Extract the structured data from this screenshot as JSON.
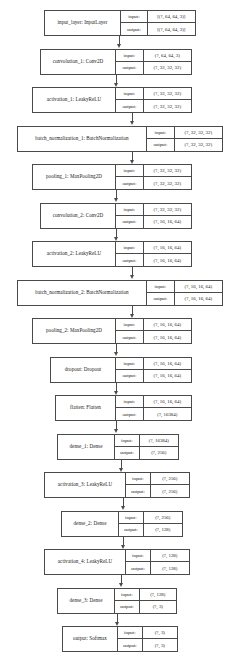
{
  "diagram": {
    "io_labels": {
      "input": "input:",
      "output": "output:"
    },
    "edge_icon": "arrow-down-icon",
    "nodes": [
      {
        "id": "input_layer",
        "label": "input_layer: InputLayer",
        "input": "[(?, 64, 64, 3)]",
        "output": "[(?, 64, 64, 3)]",
        "box_x": 44,
        "box_w": 152,
        "box_y": 10,
        "name_w": 77,
        "io_label_w": 27,
        "io_shape_w": 48
      },
      {
        "id": "convolution_1",
        "label": "convolution_1: Conv2D",
        "input": "(?, 64, 64, 3)",
        "output": "(?, 32, 32, 32)",
        "box_x": 40,
        "box_w": 152,
        "box_y": 63,
        "name_w": 76,
        "io_label_w": 28,
        "io_shape_w": 48
      },
      {
        "id": "activation_1",
        "label": "activation_1: LeakyReLU",
        "input": "(?, 32, 32, 32)",
        "output": "(?, 32, 32, 32)",
        "box_x": 32,
        "box_w": 160,
        "box_y": 116,
        "name_w": 84,
        "io_label_w": 28,
        "io_shape_w": 48
      },
      {
        "id": "batch_normalization_1",
        "label": "batch_normalization_1: BatchNormalization",
        "input": "(?, 32, 32, 32)",
        "output": "(?, 32, 32, 32)",
        "box_x": 17,
        "box_w": 206,
        "box_y": 169,
        "name_w": 130,
        "io_label_w": 28,
        "io_shape_w": 48
      },
      {
        "id": "pooling_1",
        "label": "pooling_1: MaxPooling2D",
        "input": "(?, 32, 32, 32)",
        "output": "(?, 32, 32, 32)",
        "box_x": 32,
        "box_w": 160,
        "box_y": 222,
        "name_w": 84,
        "io_label_w": 28,
        "io_shape_w": 48
      },
      {
        "id": "convolution_2",
        "label": "convolution_2: Conv2D",
        "input": "(?, 32, 32, 32)",
        "output": "(?, 16, 16, 64)",
        "box_x": 40,
        "box_w": 152,
        "box_y": 275,
        "name_w": 76,
        "io_label_w": 28,
        "io_shape_w": 48
      },
      {
        "id": "activation_2",
        "label": "activation_2: LeakyReLU",
        "input": "(?, 16, 16, 64)",
        "output": "(?, 16, 16, 64)",
        "box_x": 32,
        "box_w": 160,
        "box_y": 328,
        "name_w": 84,
        "io_label_w": 28,
        "io_shape_w": 48
      },
      {
        "id": "batch_normalization_2",
        "label": "batch_normalization_2: BatchNormalization",
        "input": "(?, 16, 16, 64)",
        "output": "(?, 16, 16, 64)",
        "box_x": 17,
        "box_w": 206,
        "box_y": 381,
        "name_w": 130,
        "io_label_w": 28,
        "io_shape_w": 48
      },
      {
        "id": "pooling_2",
        "label": "pooling_2: MaxPooling2D",
        "input": "(?, 16, 16, 64)",
        "output": "(?, 16, 16, 64)",
        "box_x": 32,
        "box_w": 160,
        "box_y": 434,
        "name_w": 84,
        "io_label_w": 28,
        "io_shape_w": 48
      },
      {
        "id": "dropout",
        "label": "dropout: Dropout",
        "input": "(?, 16, 16, 64)",
        "output": "(?, 16, 16, 64)",
        "box_x": 50,
        "box_w": 142,
        "box_y": 487,
        "name_w": 66,
        "io_label_w": 28,
        "io_shape_w": 48
      },
      {
        "id": "flatten",
        "label": "flatten: Flatten",
        "input": "(?, 16, 16, 64)",
        "output": "(?, 16384)",
        "box_x": 55,
        "box_w": 137,
        "box_y": 540,
        "name_w": 61,
        "io_label_w": 28,
        "io_shape_w": 48
      },
      {
        "id": "dense_1",
        "label": "dense_1: Dense",
        "input": "(?, 16384)",
        "output": "(?, 256)",
        "box_x": 57,
        "box_w": 122,
        "box_y": 593,
        "name_w": 58,
        "io_label_w": 25,
        "io_shape_w": 39
      },
      {
        "id": "activation_3",
        "label": "activation_3: LeakyReLU",
        "input": "(?, 256)",
        "output": "(?, 256)",
        "box_x": 44,
        "box_w": 146,
        "box_y": 646,
        "name_w": 82,
        "io_label_w": 25,
        "io_shape_w": 39
      },
      {
        "id": "dense_2",
        "label": "dense_2: Dense",
        "input": "(?, 256)",
        "output": "(?, 128)",
        "box_x": 61,
        "box_w": 122,
        "box_y": 699,
        "name_w": 58,
        "io_label_w": 25,
        "io_shape_w": 39
      },
      {
        "id": "activation_4",
        "label": "activation_4: LeakyReLU",
        "input": "(?, 128)",
        "output": "(?, 128)",
        "box_x": 44,
        "box_w": 146,
        "box_y": 752,
        "name_w": 82,
        "io_label_w": 25,
        "io_shape_w": 39
      },
      {
        "id": "dense_3",
        "label": "dense_3: Dense",
        "input": "(?, 128)",
        "output": "(?, 3)",
        "box_x": 57,
        "box_w": 120,
        "box_y": 805,
        "name_w": 58,
        "io_label_w": 25,
        "io_shape_w": 37
      },
      {
        "id": "output",
        "label": "output: Softmax",
        "input": "(?, 3)",
        "output": "(?, 3)",
        "box_x": 62,
        "box_w": 116,
        "box_y": 858,
        "name_w": 56,
        "io_label_w": 25,
        "io_shape_w": 35
      }
    ]
  }
}
